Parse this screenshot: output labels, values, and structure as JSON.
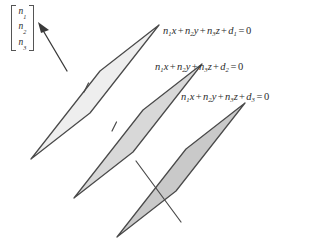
{
  "figure": {
    "width": 318,
    "height": 242,
    "background": "#ffffff"
  },
  "normal_vector": {
    "label": "normal vector column matrix",
    "open_bracket": "[",
    "close_bracket": "]",
    "entries": [
      {
        "symbol": "n",
        "subscript": "1",
        "text": "n1"
      },
      {
        "symbol": "n",
        "subscript": "2",
        "text": "n2"
      },
      {
        "symbol": "n",
        "subscript": "3",
        "text": "n3"
      }
    ]
  },
  "equations": [
    {
      "id": "equation-1",
      "full_text": "n1x + n2y + n3z + d1 = 0",
      "terms": [
        {
          "symbol": "n",
          "subscript": "1",
          "variable": "x"
        },
        {
          "symbol": "n",
          "subscript": "2",
          "variable": "y"
        },
        {
          "symbol": "n",
          "subscript": "3",
          "variable": "z"
        },
        {
          "symbol": "d",
          "subscript": "1",
          "variable": ""
        }
      ],
      "operator": "+",
      "equals": "=",
      "rhs": "0"
    },
    {
      "id": "equation-2",
      "full_text": "n1x + n2y + n3z + d2 = 0",
      "terms": [
        {
          "symbol": "n",
          "subscript": "1",
          "variable": "x"
        },
        {
          "symbol": "n",
          "subscript": "2",
          "variable": "y"
        },
        {
          "symbol": "n",
          "subscript": "3",
          "variable": "z"
        },
        {
          "symbol": "d",
          "subscript": "2",
          "variable": ""
        }
      ],
      "operator": "+",
      "equals": "=",
      "rhs": "0"
    },
    {
      "id": "equation-3",
      "full_text": "n1x + n2y + n3z + d3 = 0",
      "terms": [
        {
          "symbol": "n",
          "subscript": "1",
          "variable": "x"
        },
        {
          "symbol": "n",
          "subscript": "2",
          "variable": "y"
        },
        {
          "symbol": "n",
          "subscript": "3",
          "variable": "z"
        },
        {
          "symbol": "d",
          "subscript": "3",
          "variable": ""
        }
      ],
      "operator": "+",
      "equals": "=",
      "rhs": "0"
    }
  ],
  "planes": [
    {
      "name": "plane-1",
      "equation_ref": "equation-1",
      "fill": "#eeeeee",
      "stroke": "#4a4a4a",
      "points": "31,159 100,71 159,25 90,113"
    },
    {
      "name": "plane-2",
      "equation_ref": "equation-2",
      "fill": "#d8d8d8",
      "stroke": "#4a4a4a",
      "points": "74,198 143,110 202,64 133,152"
    },
    {
      "name": "plane-3",
      "equation_ref": "equation-3",
      "fill": "#c9c9c9",
      "stroke": "#4a4a4a",
      "points": "117,237 186,149 245,103 176,191"
    }
  ],
  "normal_stubs": [
    {
      "name": "normal-stub-plane-1",
      "x1": 84,
      "y1": 92,
      "x2": 88,
      "y2": 84
    },
    {
      "name": "normal-stub-plane-2",
      "x1": 112,
      "y1": 131,
      "x2": 116,
      "y2": 123
    }
  ],
  "normal_line": {
    "name": "normal-line-plane-3",
    "x1": 137,
    "y1": 163,
    "x2": 180,
    "y2": 221
  },
  "arrow": {
    "name": "normal-vector-arrow",
    "x1": 66,
    "y1": 70,
    "x2": 40,
    "y2": 26,
    "head": "46,24 40,26 43,33"
  },
  "colors": {
    "plane_light": "#eeeeee",
    "plane_mid": "#d8d8d8",
    "plane_dark": "#c9c9c9",
    "stroke": "#4a4a4a",
    "text": "#2b2b2b",
    "background": "#ffffff"
  }
}
